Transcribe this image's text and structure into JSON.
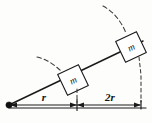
{
  "figure": {
    "background_color": "#fdfdfc",
    "line_color": "#1a1a1a",
    "dashed_color": "#3a3a3a"
  },
  "blocks": [
    {
      "id": "inner-block",
      "label": "m",
      "distance_label": "r"
    },
    {
      "id": "outer-block",
      "label": "m",
      "distance_label": "2r"
    }
  ],
  "dimensions": [
    {
      "id": "segment-r",
      "label": "r"
    },
    {
      "id": "segment-2r",
      "label": "2r"
    }
  ],
  "pivot": {
    "label": ""
  },
  "arcs": [
    {
      "id": "inner-arc",
      "label": ""
    },
    {
      "id": "outer-arc",
      "label": ""
    }
  ]
}
